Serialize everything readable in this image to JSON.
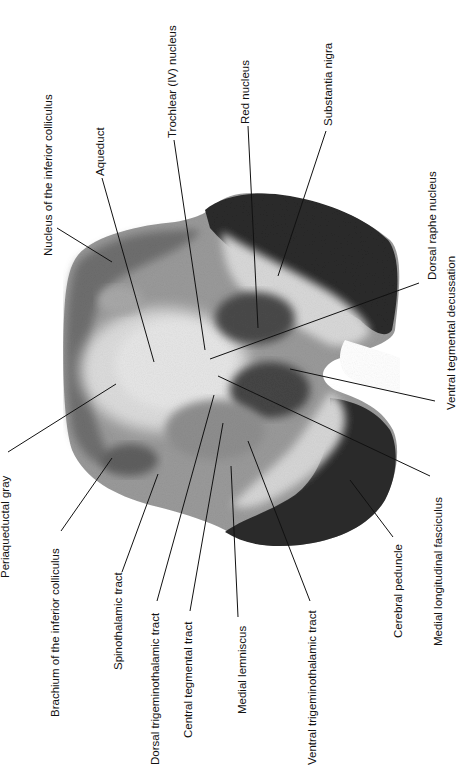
{
  "figure": {
    "background_color": "#ffffff",
    "tissue_colors": {
      "dark": "#2b2b2b",
      "mid": "#7a7a7a",
      "light": "#d4d4d4",
      "pale": "#e9e9e9"
    }
  },
  "labels": {
    "top": [
      {
        "id": "nucleus-inferior-colliculus",
        "text": "Nucleus of the inferior colliculus"
      },
      {
        "id": "aqueduct",
        "text": "Aqueduct"
      },
      {
        "id": "trochlear-nucleus",
        "text": "Trochlear (IV) nucleus"
      },
      {
        "id": "red-nucleus",
        "text": "Red nucleus"
      },
      {
        "id": "substantia-nigra",
        "text": "Substantia nigra"
      },
      {
        "id": "dorsal-raphe-nucleus",
        "text": "Dorsal raphe nucleus"
      }
    ],
    "bottom": [
      {
        "id": "periaqueductal-gray",
        "text": "Periaqueductal gray"
      },
      {
        "id": "brachium-inferior-colliculus",
        "text": "Brachium of the inferior colliculus"
      },
      {
        "id": "spinothalamic-tract",
        "text": "Spinothalamic tract"
      },
      {
        "id": "dorsal-trigeminothalamic-tract",
        "text": "Dorsal trigeminothalamic tract"
      },
      {
        "id": "central-tegmental-tract",
        "text": "Central tegmental tract"
      },
      {
        "id": "medial-lemniscus",
        "text": "Medial lemniscus"
      },
      {
        "id": "ventral-trigeminothalamic-tract",
        "text": "Ventral trigeminothalamic tract"
      },
      {
        "id": "cerebral-peduncle",
        "text": "Cerebral peduncle"
      },
      {
        "id": "medial-longitudinal-fasciculus",
        "text": "Medial longitudinal fasciculus"
      },
      {
        "id": "ventral-tegmental-decussation",
        "text": "Ventral tegmental decussation"
      }
    ]
  }
}
